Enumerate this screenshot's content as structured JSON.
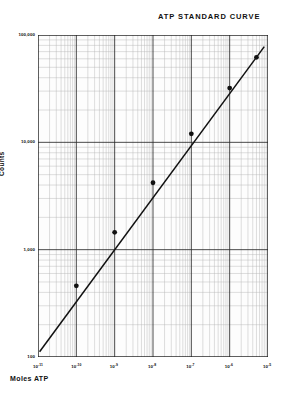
{
  "title": "ATP STANDARD CURVE",
  "chart_data": {
    "type": "scatter",
    "title": "ATP STANDARD CURVE",
    "xlabel": "Moles ATP",
    "ylabel": "Counts",
    "xscale": "log",
    "yscale": "log",
    "grid": true,
    "legend": "none",
    "xlim": [
      1e-11,
      1e-05
    ],
    "ylim": [
      100,
      100000
    ],
    "x_tick_labels": [
      "10⁻¹¹",
      "10⁻¹⁰",
      "10⁻⁹",
      "10⁻⁸",
      "10⁻⁷",
      "10⁻⁶",
      "10⁻⁵"
    ],
    "x_tick_mantissas": [
      "10",
      "10",
      "10",
      "10",
      "10",
      "10",
      "10"
    ],
    "x_tick_exponents": [
      "-11",
      "-10",
      "-9",
      "-8",
      "-7",
      "-6",
      "-5"
    ],
    "x_tick_values": [
      1e-11,
      1e-10,
      1e-09,
      1e-08,
      1e-07,
      1e-06,
      1e-05
    ],
    "y_tick_labels": [
      "100,000",
      "10,000",
      "1,000",
      "100"
    ],
    "y_tick_values": [
      100000,
      10000,
      1000,
      100
    ],
    "series": [
      {
        "name": "ATP standard",
        "marker": "filled-circle",
        "color": "#111111",
        "line": "best-fit",
        "x": [
          1e-10,
          1e-09,
          1e-08,
          1e-07,
          1e-06,
          5e-06
        ],
        "y": [
          460,
          1450,
          4200,
          12000,
          32000,
          62000
        ]
      }
    ],
    "fit_line": {
      "x": [
        1.1e-11,
        8e-06
      ],
      "y": [
        112,
        78000
      ]
    }
  },
  "axes": {
    "y_title": "Counts",
    "x_title": "Moles ATP"
  }
}
